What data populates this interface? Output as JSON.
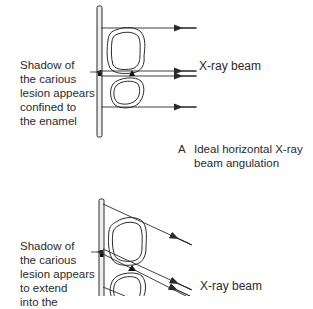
{
  "panel_a": {
    "shadow_label": "Shadow of\nthe carious\nlesion appears\nconfined to\nthe enamel",
    "beam_label": "X-ray beam",
    "caption_letter": "A",
    "caption": "Ideal horizontal X-ray\nbeam angulation"
  },
  "panel_b": {
    "shadow_label": "Shadow of\nthe carious\nlesion appears\nto extend\ninto the",
    "beam_label": "X-ray beam"
  },
  "colors": {
    "line": "#2a2a2a",
    "film_fill": "#eeeeee",
    "background": "#ffffff"
  }
}
